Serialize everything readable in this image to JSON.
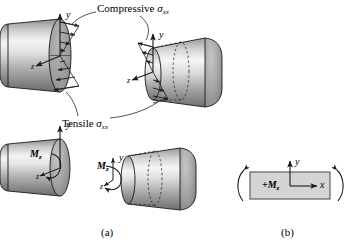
{
  "figure": {
    "title_compressive": "Compressive",
    "title_tensile": "Tensile",
    "stress_symbol": "σ",
    "stress_subscript": "xx",
    "panel_a_label": "(a)",
    "panel_b_label": "(b)",
    "moment_symbol": "M",
    "moment_subscript": "z",
    "moment_positive": "+M",
    "axis_x": "x",
    "axis_y": "y",
    "axis_z": "z",
    "colors": {
      "outline": "#1a1a1a",
      "cylinder_light": "#f2f2f2",
      "cylinder_mid": "#b8b8b8",
      "cylinder_dark": "#6e6e6e",
      "end_cap": "#a8a8a8",
      "section_face": "#9a9a9a",
      "rect_fill": "#d4d4d4",
      "background": "#ffffff"
    },
    "elements": {
      "cylinder_top_left": "cylinder with compressive and tensile stress arrows on cut face",
      "cylinder_top_right": "cylinder viewed from opposite side with hidden dashed section",
      "cylinder_bottom_left": "cylinder with bending moment Mz vector",
      "cylinder_bottom_right": "cylinder with bending moment Mz and dashed section",
      "panel_b_rect": "rectangular side view of beam with +Mz and curved bending arrows"
    }
  }
}
